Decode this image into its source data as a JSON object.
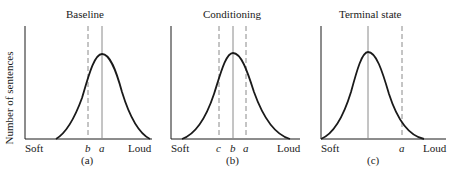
{
  "figure": {
    "y_axis_label": "Number of sentences",
    "panels": [
      {
        "title": "Baseline",
        "caption": "(a)",
        "x_left_label": "Soft",
        "x_right_label": "Loud",
        "markers": [
          {
            "label": "b",
            "style": "dashed"
          },
          {
            "label": "a",
            "style": "solid"
          }
        ]
      },
      {
        "title": "Conditioning",
        "caption": "(b)",
        "x_left_label": "Soft",
        "x_right_label": "Loud",
        "markers": [
          {
            "label": "c",
            "style": "dashed"
          },
          {
            "label": "b",
            "style": "solid"
          },
          {
            "label": "a",
            "style": "dashed"
          }
        ]
      },
      {
        "title": "Terminal state",
        "caption": "(c)",
        "x_left_label": "Soft",
        "x_right_label": "Loud",
        "markers": [
          {
            "label": "",
            "style": "solid"
          },
          {
            "label": "a",
            "style": "dashed"
          }
        ]
      }
    ]
  },
  "colors": {
    "ink": "#1a1a1a",
    "guide": "#8a8a8a"
  }
}
